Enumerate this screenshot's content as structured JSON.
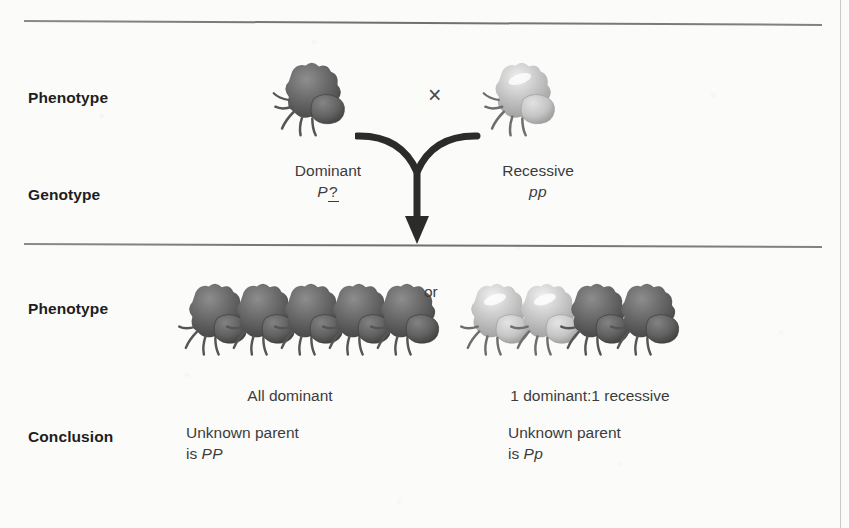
{
  "figure": {
    "type": "genetics-testcross-diagram",
    "background_color": "#fbfbfa",
    "rule_color": "#6e6e6e"
  },
  "row_labels": {
    "phenotype_parents": "Phenotype",
    "genotype_parents": "Genotype",
    "phenotype_offspring": "Phenotype",
    "conclusion": "Conclusion"
  },
  "parents": {
    "cross_symbol": "×",
    "dominant": {
      "phenotype_label": "Dominant",
      "genotype_allele": "P",
      "genotype_unknown": "?",
      "specimen_color": "dark",
      "specimen_icon": "fruit-specimen-icon"
    },
    "recessive": {
      "phenotype_label": "Recessive",
      "genotype": "pp",
      "specimen_color": "light",
      "specimen_icon": "fruit-specimen-icon"
    }
  },
  "offspring": {
    "separator": "or",
    "outcome_a": {
      "result_label": "All dominant",
      "conclusion_line1": "Unknown parent",
      "conclusion_line2_prefix": "is ",
      "conclusion_genotype": "PP",
      "specimens": [
        {
          "shade": "dark"
        },
        {
          "shade": "dark"
        },
        {
          "shade": "dark"
        },
        {
          "shade": "dark"
        },
        {
          "shade": "dark"
        }
      ]
    },
    "outcome_b": {
      "result_label": "1 dominant:1 recessive",
      "conclusion_line1": "Unknown parent",
      "conclusion_line2_prefix": "is ",
      "conclusion_genotype": "Pp",
      "specimens": [
        {
          "shade": "light"
        },
        {
          "shade": "light"
        },
        {
          "shade": "dark"
        },
        {
          "shade": "dark"
        }
      ]
    }
  }
}
